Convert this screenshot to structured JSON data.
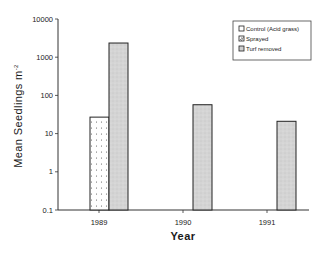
{
  "chart_data": {
    "type": "bar",
    "title": "",
    "xlabel": "Year",
    "ylabel": "Mean Seedlings m",
    "ylabel_superscript": "-2",
    "yscale": "log",
    "ylim": [
      0.1,
      10000
    ],
    "yticks": [
      "10000",
      "1000",
      "100",
      "10",
      "1",
      "0.1"
    ],
    "categories": [
      "1989",
      "1990",
      "1991"
    ],
    "series": [
      {
        "name": "Control (Acid grass)",
        "values": [
          null,
          null,
          null
        ],
        "pattern": "none"
      },
      {
        "name": "Sprayed",
        "values": [
          27,
          null,
          null
        ],
        "pattern": "dotted"
      },
      {
        "name": "Turf removed",
        "values": [
          2350,
          57,
          21
        ],
        "pattern": "grey-stipple"
      }
    ],
    "legend_position": "upper right",
    "grid": false
  },
  "legend": {
    "items": [
      {
        "label": "Control (Acid grass)"
      },
      {
        "label": "Sprayed"
      },
      {
        "label": "Turf removed"
      }
    ]
  },
  "colors": {
    "axis": "#333333",
    "bar_outline": "#222222",
    "turf_fill": "#d6d6d6",
    "sprayed_fill": "#ffffff",
    "dot": "#555555"
  }
}
